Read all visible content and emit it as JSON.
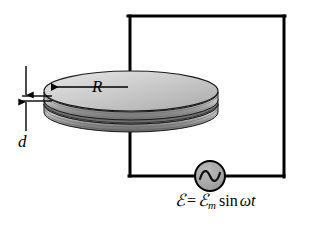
{
  "figure": {
    "background_color": "#ffffff",
    "wire_color": "#000000",
    "plate_fill_light": "#d8d8d8",
    "plate_fill_mid": "#b4b4b4",
    "plate_fill_dark": "#8c8c8c",
    "source_fill": "#a6a6a6"
  },
  "labels": {
    "radius": "R",
    "separation": "d"
  },
  "equation": {
    "emf_symbol": "ℰ",
    "equals": "=",
    "amplitude_symbol": "ℰ",
    "amplitude_subscript": "m",
    "function": "sin",
    "omega": "ω",
    "time": "t",
    "full_text": "ℰ = ℰm sin ωt"
  },
  "components": {
    "ac_source_name": "ac-source",
    "ac_source_glyph": "sine-wave",
    "capacitor_name": "parallel-plate-capacitor",
    "plate_count": 2
  },
  "icons": {
    "radius_arrow": "arrow-left-icon",
    "separation_arrow_top": "arrow-down-icon",
    "separation_arrow_bottom": "arrow-up-icon",
    "ac_waveform": "sine-wave-icon"
  }
}
